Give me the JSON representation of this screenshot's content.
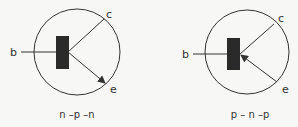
{
  "diagram": {
    "symbols": [
      {
        "type": "npn",
        "caption": "n –p –n",
        "labels": {
          "base": "b",
          "collector": "c",
          "emitter": "e"
        },
        "arrow_direction": "outward"
      },
      {
        "type": "pnp",
        "caption": "p – n –p",
        "labels": {
          "base": "b",
          "collector": "c",
          "emitter": "e"
        },
        "arrow_direction": "inward"
      }
    ],
    "colors": {
      "stroke": "#333333",
      "fill": "#2a2a2a",
      "background": "#f7f7f5"
    }
  }
}
